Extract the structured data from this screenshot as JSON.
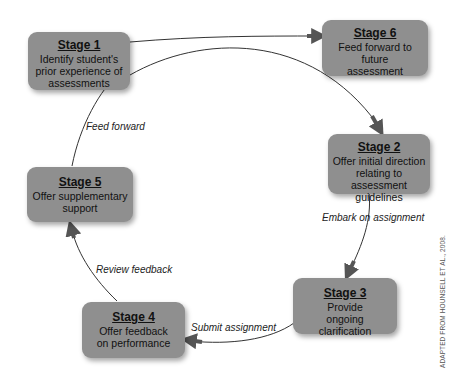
{
  "diagram": {
    "type": "cycle",
    "stages": [
      {
        "id": "stage1",
        "title": "Stage 1",
        "description": "Identify student's prior experience of assessments"
      },
      {
        "id": "stage2",
        "title": "Stage 2",
        "description": "Offer initial direction relating to assessment guidelines"
      },
      {
        "id": "stage3",
        "title": "Stage 3",
        "description": "Provide ongoing clarification"
      },
      {
        "id": "stage4",
        "title": "Stage 4",
        "description": "Offer feedback on performance"
      },
      {
        "id": "stage5",
        "title": "Stage 5",
        "description": "Offer supplementary support"
      },
      {
        "id": "stage6",
        "title": "Stage 6",
        "description": "Feed forward to future assessment"
      }
    ],
    "transitions": [
      {
        "from": "stage1",
        "to": "stage2",
        "label": ""
      },
      {
        "from": "stage2",
        "to": "stage3",
        "label": "Embark on assignment"
      },
      {
        "from": "stage3",
        "to": "stage4",
        "label": "Submit assignment"
      },
      {
        "from": "stage4",
        "to": "stage5",
        "label": "Review feedback"
      },
      {
        "from": "stage5",
        "to": "stage6",
        "label": "Feed forward"
      },
      {
        "from": "stage1",
        "to": "stage6",
        "label": ""
      }
    ],
    "credit": "ADAPTED FROM HOUNSELL ET AL., 2008."
  },
  "colors": {
    "box_fill": "#8f8f8f",
    "line": "#333333",
    "arrow": "#555555"
  }
}
